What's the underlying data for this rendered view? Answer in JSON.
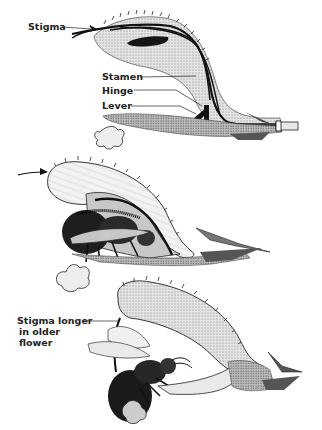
{
  "figure": {
    "panels": [
      {
        "id": "top",
        "subject": "Cross-section of young flower showing internal structures",
        "labels": [
          {
            "text": "Stigma",
            "x": 28,
            "y": 22
          },
          {
            "text": "Stamen",
            "x": 102,
            "y": 68
          },
          {
            "text": "Hinge",
            "x": 102,
            "y": 84
          },
          {
            "text": "Lever",
            "x": 102,
            "y": 100
          }
        ]
      },
      {
        "id": "middle",
        "subject": "Bee entering flower, pushing lever so stamen arches down onto its back",
        "labels": []
      },
      {
        "id": "bottom",
        "subject": "Bee visiting older flower where stigma has lengthened to touch its back",
        "labels": [
          {
            "text": "Stigma longer in older flower",
            "lines": [
              "Stigma longer",
              "in older",
              "flower"
            ],
            "x": 17,
            "y": 314
          }
        ]
      }
    ],
    "colors": {
      "ink": "#111111",
      "stipple": "#8a8a8a",
      "shade_light": "#d6d6d6",
      "shade_mid": "#b0b0b0",
      "background": "#ffffff"
    }
  }
}
